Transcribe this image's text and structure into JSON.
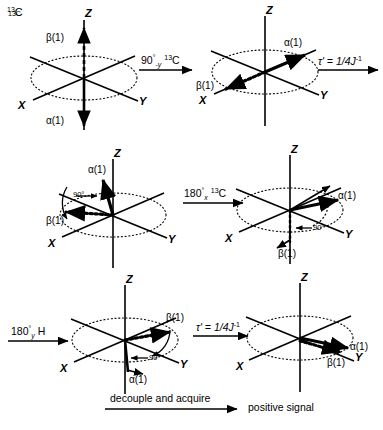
{
  "figure": {
    "nucleus_label": "13C",
    "caption_arrow_label": "decouple and acquire",
    "result_label": "positive signal"
  },
  "axes": {
    "x": "X",
    "y": "Y",
    "z": "Z"
  },
  "vectors": {
    "alpha": "α(1)",
    "beta": "β(1)",
    "angle_90": "90°"
  },
  "operations": [
    {
      "id": "op-90-minus-y-13c",
      "main": "90",
      "deg": "°",
      "sub": "-y",
      "sup_nuc": "13",
      "nuc": "C",
      "full": "90°-y 13C"
    },
    {
      "id": "op-tau-1",
      "main": "τ' = 1/4J",
      "sup": "-1",
      "full": "τ' = 1/4J-1"
    },
    {
      "id": "op-180-x-13c",
      "main": "180",
      "deg": "°",
      "sub": "x",
      "sup_nuc": "13",
      "nuc": "C",
      "full": "180°x 13C"
    },
    {
      "id": "op-180-y-h",
      "main": "180",
      "deg": "°",
      "sub": "y",
      "nuc": "H",
      "full": "180°y H"
    },
    {
      "id": "op-tau-2",
      "main": "τ' = 1/4J",
      "sup": "-1",
      "full": "τ' = 1/4J-1"
    }
  ],
  "panels": [
    {
      "id": "panel-1",
      "name": "initial-z-magnetization",
      "alpha_label": "α(1)",
      "beta_label": "β(1)",
      "alpha_direction": "-Z",
      "beta_direction": "+Z"
    },
    {
      "id": "panel-2",
      "name": "after-90-pulse",
      "alpha_label": "α(1)",
      "beta_label": "β(1)",
      "alpha_direction": "+X-upper",
      "beta_direction": "-X-lower"
    },
    {
      "id": "panel-3",
      "name": "after-first-tau-evolution",
      "alpha_label": "α(1)",
      "beta_label": "β(1)",
      "angle_label": "90°"
    },
    {
      "id": "panel-4",
      "name": "after-180-x-13c",
      "alpha_label": "α(1)",
      "beta_label": "β(1)",
      "angle_label": "90°"
    },
    {
      "id": "panel-5",
      "name": "after-180-y-proton",
      "alpha_label": "α(1)",
      "beta_label": "β(1)",
      "angle_label": "90°"
    },
    {
      "id": "panel-6",
      "name": "refocused-along-y",
      "alpha_label": "α(1)",
      "beta_label": "β(1)"
    }
  ],
  "colors": {
    "stroke": "#000000",
    "background": "#ffffff"
  }
}
